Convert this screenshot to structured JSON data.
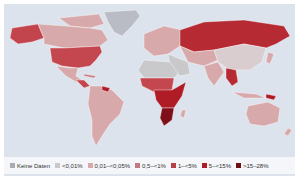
{
  "map": {
    "ocean_color": "#dde3ec",
    "legend": [
      {
        "label": "Keine Daten",
        "color": "#a9abb3"
      },
      {
        "label": "<0,01%",
        "color": "#c9c9cc"
      },
      {
        "label": "0,01–<0,05%",
        "color": "#d8a9aa"
      },
      {
        "label": "0,5–<1%",
        "color": "#c27a80"
      },
      {
        "label": "1–<5%",
        "color": "#b84048"
      },
      {
        "label": "5–<15%",
        "color": "#b01c26"
      },
      {
        "label": ">15–28%",
        "color": "#6e0d16"
      }
    ],
    "regions": [
      {
        "name": "Greenland",
        "class": "Keine Daten"
      },
      {
        "name": "Canada",
        "class": "0,01–<0,05%"
      },
      {
        "name": "Alaska",
        "class": "1–<5%"
      },
      {
        "name": "USA",
        "class": "0,5–<1%"
      },
      {
        "name": "Mexico",
        "class": "0,01–<0,05%"
      },
      {
        "name": "Central America",
        "class": "1–<5%"
      },
      {
        "name": "South America",
        "class": "0,01–<0,05%"
      },
      {
        "name": "Europe",
        "class": "0,01–<0,05%"
      },
      {
        "name": "Russia",
        "class": "1–<5%"
      },
      {
        "name": "Central Asia",
        "class": "0,01–<0,05%"
      },
      {
        "name": "China",
        "class": "<0,01%"
      },
      {
        "name": "Southeast Asia",
        "class": "1–<5%"
      },
      {
        "name": "North Africa",
        "class": "<0,01%"
      },
      {
        "name": "Sub-Saharan Africa",
        "class": "5–<15%"
      },
      {
        "name": "Southern Africa",
        "class": ">15–28%"
      },
      {
        "name": "Australia",
        "class": "0,01–<0,05%"
      },
      {
        "name": "Papua New Guinea",
        "class": "1–<5%"
      }
    ]
  }
}
